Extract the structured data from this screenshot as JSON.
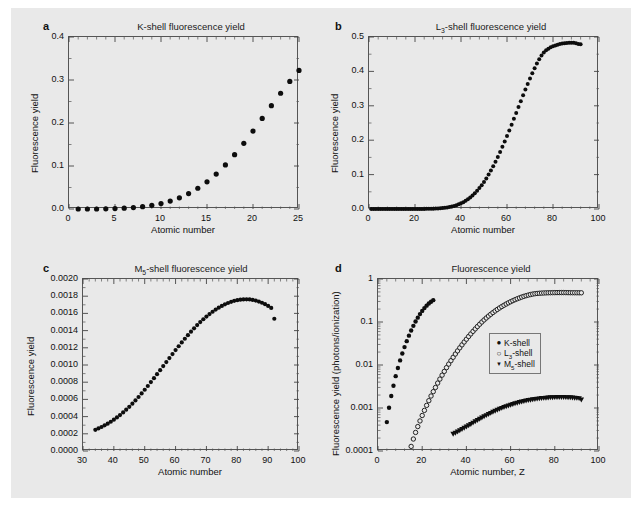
{
  "figure": {
    "background": "#e9e9e9",
    "marker_color": "#0d0d0d"
  },
  "panels": [
    {
      "letter": "a",
      "title": "K-shell fluorescence yield",
      "xlabel": "Atomic number",
      "ylabel": "Fluorescence yield",
      "xticks": [
        "0",
        "5",
        "10",
        "15",
        "20",
        "25"
      ],
      "yticks": [
        "0.0",
        "0.1",
        "0.2",
        "0.3",
        "0.4"
      ]
    },
    {
      "letter": "b",
      "title_prefix": "L",
      "title_sub": "3",
      "title_suffix": "-shell fluorescence yield",
      "xlabel": "Atomic number",
      "ylabel": "Fluorescence yield",
      "xticks": [
        "0",
        "20",
        "40",
        "60",
        "80",
        "100"
      ],
      "yticks": [
        "0.0",
        "0.1",
        "0.2",
        "0.3",
        "0.4",
        "0.5"
      ]
    },
    {
      "letter": "c",
      "title_prefix": "M",
      "title_sub": "5",
      "title_suffix": "-shell fluorescence yield",
      "xlabel": "Atomic number",
      "ylabel": "Fluorescence yield",
      "xticks": [
        "30",
        "40",
        "50",
        "60",
        "70",
        "80",
        "90",
        "100"
      ],
      "yticks": [
        "0.0000",
        "0.0002",
        "0.0004",
        "0.0006",
        "0.0008",
        "0.0010",
        "0.0012",
        "0.0014",
        "0.0016",
        "0.0018",
        "0.0020"
      ]
    },
    {
      "letter": "d",
      "title": "Fluorescence yield",
      "xlabel": "Atomic number, Z",
      "ylabel": "Fluorescence yield (photons/ionization)",
      "xticks": [
        "0",
        "20",
        "40",
        "60",
        "80",
        "100"
      ],
      "yticks": [
        "0.0001",
        "0.001",
        "0.01",
        "0.1",
        "1"
      ],
      "legend": [
        {
          "marker": "filled-circle",
          "glyph": "●",
          "label_prefix": "K",
          "label_sub": "",
          "label_suffix": "-shell"
        },
        {
          "marker": "open-circle",
          "glyph": "○",
          "label_prefix": "L",
          "label_sub": "3",
          "label_suffix": "-shell"
        },
        {
          "marker": "filled-triangle",
          "glyph": "▼",
          "label_prefix": "M",
          "label_sub": "5",
          "label_suffix": "-shell"
        }
      ]
    }
  ],
  "chart_data": [
    {
      "panel": "a",
      "type": "scatter",
      "title": "K-shell fluorescence yield",
      "xlabel": "Atomic number",
      "ylabel": "Fluorescence yield",
      "xlim": [
        0,
        25
      ],
      "ylim": [
        0,
        0.4
      ],
      "xscale": "linear",
      "yscale": "linear",
      "grid": false,
      "marker": "filled-circle",
      "series": [
        {
          "name": "K-shell",
          "x": [
            1,
            2,
            3,
            4,
            5,
            6,
            7,
            8,
            9,
            10,
            11,
            12,
            13,
            14,
            15,
            16,
            17,
            18,
            19,
            20,
            21,
            22,
            23,
            24,
            25
          ],
          "y": [
            0.0,
            0.0,
            0.0,
            0.0005,
            0.001,
            0.0019,
            0.0033,
            0.0055,
            0.0085,
            0.0128,
            0.0185,
            0.0261,
            0.0359,
            0.0482,
            0.0633,
            0.0813,
            0.1024,
            0.1263,
            0.1528,
            0.1812,
            0.2106,
            0.2402,
            0.2692,
            0.2968,
            0.3223
          ]
        }
      ]
    },
    {
      "panel": "b",
      "type": "scatter",
      "title": "L3-shell fluorescence yield",
      "xlabel": "Atomic number",
      "ylabel": "Fluorescence yield",
      "xlim": [
        0,
        100
      ],
      "ylim": [
        0,
        0.5
      ],
      "xscale": "linear",
      "yscale": "linear",
      "grid": false,
      "marker": "filled-circle",
      "series": [
        {
          "name": "L3-shell",
          "x": [
            1,
            2,
            3,
            4,
            5,
            6,
            7,
            8,
            9,
            10,
            11,
            12,
            13,
            14,
            15,
            16,
            17,
            18,
            19,
            20,
            21,
            22,
            23,
            24,
            25,
            26,
            27,
            28,
            29,
            30,
            31,
            32,
            33,
            34,
            35,
            36,
            37,
            38,
            39,
            40,
            41,
            42,
            43,
            44,
            45,
            46,
            47,
            48,
            49,
            50,
            51,
            52,
            53,
            54,
            55,
            56,
            57,
            58,
            59,
            60,
            61,
            62,
            63,
            64,
            65,
            66,
            67,
            68,
            69,
            70,
            71,
            72,
            73,
            74,
            75,
            76,
            77,
            78,
            79,
            80,
            81,
            82,
            83,
            84,
            85,
            86,
            87,
            88,
            89,
            90,
            91,
            92
          ],
          "y": [
            0.0,
            0.0,
            0.0,
            0.0,
            0.0,
            0.0,
            0.0,
            0.0,
            0.0,
            0.0,
            0.0,
            0.0,
            0.0,
            0.0,
            0.0,
            0.0,
            0.0,
            0.0,
            0.0001,
            0.0001,
            0.0001,
            0.0002,
            0.0002,
            0.0003,
            0.0004,
            0.0005,
            0.0007,
            0.0009,
            0.0012,
            0.0016,
            0.0021,
            0.0027,
            0.0035,
            0.0045,
            0.0057,
            0.0071,
            0.0089,
            0.011,
            0.0135,
            0.0164,
            0.0198,
            0.0238,
            0.0283,
            0.0334,
            0.0392,
            0.0456,
            0.0528,
            0.0607,
            0.0694,
            0.0788,
            0.089,
            0.1,
            0.1117,
            0.1241,
            0.1373,
            0.1511,
            0.1655,
            0.1806,
            0.1961,
            0.2121,
            0.2285,
            0.2452,
            0.2621,
            0.2792,
            0.2963,
            0.3134,
            0.3304,
            0.3471,
            0.3635,
            0.3794,
            0.3948,
            0.4094,
            0.423,
            0.4354,
            0.4461,
            0.4548,
            0.4613,
            0.4662,
            0.47,
            0.473,
            0.4756,
            0.4778,
            0.4796,
            0.481,
            0.482,
            0.4826,
            0.483,
            0.4832,
            0.483,
            0.482,
            0.48,
            0.479
          ]
        }
      ]
    },
    {
      "panel": "c",
      "type": "scatter",
      "title": "M5-shell fluorescence yield",
      "xlabel": "Atomic number",
      "ylabel": "Fluorescence yield",
      "xlim": [
        30,
        100
      ],
      "ylim": [
        0,
        0.002
      ],
      "xscale": "linear",
      "yscale": "linear",
      "grid": false,
      "marker": "filled-circle",
      "series": [
        {
          "name": "M5-shell",
          "x": [
            34,
            35,
            36,
            37,
            38,
            39,
            40,
            41,
            42,
            43,
            44,
            45,
            46,
            47,
            48,
            49,
            50,
            51,
            52,
            53,
            54,
            55,
            56,
            57,
            58,
            59,
            60,
            61,
            62,
            63,
            64,
            65,
            66,
            67,
            68,
            69,
            70,
            71,
            72,
            73,
            74,
            75,
            76,
            77,
            78,
            79,
            80,
            81,
            82,
            83,
            84,
            85,
            86,
            87,
            88,
            89,
            90,
            91,
            92
          ],
          "y": [
            0.000246,
            0.000262,
            0.000279,
            0.000298,
            0.000318,
            0.00034,
            0.000364,
            0.00039,
            0.000418,
            0.000448,
            0.00048,
            0.000514,
            0.00055,
            0.000588,
            0.000628,
            0.000669,
            0.000712,
            0.000756,
            0.000801,
            0.000847,
            0.000893,
            0.00094,
            0.000987,
            0.001034,
            0.001081,
            0.001127,
            0.001173,
            0.001218,
            0.001262,
            0.001305,
            0.001347,
            0.001388,
            0.001427,
            0.001464,
            0.001499,
            0.001532,
            0.001563,
            0.001592,
            0.001619,
            0.001644,
            0.001667,
            0.001687,
            0.001705,
            0.001721,
            0.001735,
            0.001746,
            0.001754,
            0.00176,
            0.001763,
            0.001764,
            0.001762,
            0.001757,
            0.001749,
            0.001738,
            0.001724,
            0.001707,
            0.001687,
            0.001664,
            0.001538
          ]
        }
      ]
    },
    {
      "panel": "d",
      "type": "scatter",
      "title": "Fluorescence yield",
      "xlabel": "Atomic number, Z",
      "ylabel": "Fluorescence yield (photons/ionization)",
      "xlim": [
        0,
        100
      ],
      "ylim": [
        0.0001,
        1
      ],
      "xscale": "linear",
      "yscale": "log",
      "grid": false,
      "legend_position": "center-right",
      "series": [
        {
          "name": "K-shell",
          "marker": "filled-circle",
          "x": [
            4,
            5,
            6,
            7,
            8,
            9,
            10,
            11,
            12,
            13,
            14,
            15,
            16,
            17,
            18,
            19,
            20,
            21,
            22,
            23,
            24,
            25
          ],
          "y": [
            0.00047,
            0.00101,
            0.0019,
            0.0033,
            0.0055,
            0.0085,
            0.0128,
            0.0185,
            0.0261,
            0.0359,
            0.0482,
            0.0633,
            0.0813,
            0.1024,
            0.1263,
            0.1528,
            0.1812,
            0.2106,
            0.2402,
            0.2692,
            0.2968,
            0.3223
          ]
        },
        {
          "name": "L3-shell",
          "marker": "open-circle",
          "x": [
            15,
            16,
            17,
            18,
            19,
            20,
            21,
            22,
            23,
            24,
            25,
            26,
            27,
            28,
            29,
            30,
            31,
            32,
            33,
            34,
            35,
            36,
            37,
            38,
            39,
            40,
            41,
            42,
            43,
            44,
            45,
            46,
            47,
            48,
            49,
            50,
            51,
            52,
            53,
            54,
            55,
            56,
            57,
            58,
            59,
            60,
            61,
            62,
            63,
            64,
            65,
            66,
            67,
            68,
            69,
            70,
            71,
            72,
            73,
            74,
            75,
            76,
            77,
            78,
            79,
            80,
            81,
            82,
            83,
            84,
            85,
            86,
            87,
            88,
            89,
            90,
            91,
            92
          ],
          "y": [
            0.000128,
            0.00019,
            0.00027,
            0.00037,
            0.0005,
            0.00067,
            0.00088,
            0.00115,
            0.00148,
            0.0019,
            0.0024,
            0.003,
            0.0038,
            0.0047,
            0.0058,
            0.0071,
            0.0087,
            0.0105,
            0.0126,
            0.0151,
            0.018,
            0.0213,
            0.0251,
            0.0294,
            0.0343,
            0.0398,
            0.046,
            0.0529,
            0.0606,
            0.0691,
            0.0785,
            0.0888,
            0.1,
            0.1117,
            0.1241,
            0.1373,
            0.1511,
            0.1655,
            0.1806,
            0.1961,
            0.2121,
            0.2285,
            0.2452,
            0.2621,
            0.2792,
            0.2963,
            0.3134,
            0.3304,
            0.3471,
            0.3635,
            0.3794,
            0.3948,
            0.4094,
            0.423,
            0.4354,
            0.4461,
            0.4548,
            0.4613,
            0.4662,
            0.47,
            0.473,
            0.4756,
            0.4778,
            0.4796,
            0.481,
            0.482,
            0.4826,
            0.483,
            0.4832,
            0.483,
            0.482,
            0.481,
            0.48,
            0.4795,
            0.479,
            0.4785,
            0.478,
            0.4775
          ]
        },
        {
          "name": "M5-shell",
          "marker": "filled-triangle",
          "x": [
            34,
            35,
            36,
            37,
            38,
            39,
            40,
            41,
            42,
            43,
            44,
            45,
            46,
            47,
            48,
            49,
            50,
            51,
            52,
            53,
            54,
            55,
            56,
            57,
            58,
            59,
            60,
            61,
            62,
            63,
            64,
            65,
            66,
            67,
            68,
            69,
            70,
            71,
            72,
            73,
            74,
            75,
            76,
            77,
            78,
            79,
            80,
            81,
            82,
            83,
            84,
            85,
            86,
            87,
            88,
            89,
            90,
            91,
            92
          ],
          "y": [
            0.000246,
            0.000262,
            0.000279,
            0.000298,
            0.000318,
            0.00034,
            0.000364,
            0.00039,
            0.000418,
            0.000448,
            0.00048,
            0.000514,
            0.00055,
            0.000588,
            0.000628,
            0.000669,
            0.000712,
            0.000756,
            0.000801,
            0.000847,
            0.000893,
            0.00094,
            0.000987,
            0.001034,
            0.001081,
            0.001127,
            0.001173,
            0.001218,
            0.001262,
            0.001305,
            0.001347,
            0.001388,
            0.001427,
            0.001464,
            0.001499,
            0.001532,
            0.001563,
            0.001592,
            0.001619,
            0.001644,
            0.001667,
            0.001687,
            0.001705,
            0.001721,
            0.001735,
            0.001746,
            0.001754,
            0.00176,
            0.001763,
            0.001764,
            0.001762,
            0.001757,
            0.001749,
            0.001738,
            0.001724,
            0.001707,
            0.001687,
            0.001664,
            0.001538
          ]
        }
      ]
    }
  ]
}
